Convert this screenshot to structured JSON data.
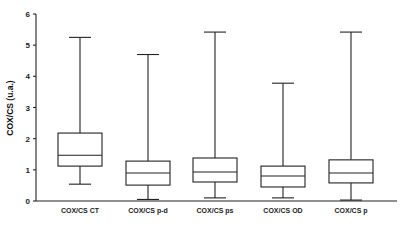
{
  "chart_data": {
    "type": "box",
    "title": "",
    "xlabel": "",
    "ylabel": "COX/CS (u.a.)",
    "ylim": [
      0,
      6
    ],
    "yticks": [
      0,
      1,
      2,
      3,
      4,
      5,
      6
    ],
    "grid": false,
    "categories": [
      "COX/CS CT",
      "COX/CS p-d",
      "COX/CS ps",
      "COX/CS OD",
      "COX/CS p"
    ],
    "series": [
      {
        "name": "COX/CS CT",
        "min": 0.54,
        "q1": 1.12,
        "median": 1.47,
        "q3": 2.18,
        "max": 5.25
      },
      {
        "name": "COX/CS p-d",
        "min": 0.05,
        "q1": 0.51,
        "median": 0.9,
        "q3": 1.28,
        "max": 4.7
      },
      {
        "name": "COX/CS ps",
        "min": 0.1,
        "q1": 0.61,
        "median": 0.93,
        "q3": 1.38,
        "max": 5.42
      },
      {
        "name": "COX/CS OD",
        "min": 0.1,
        "q1": 0.45,
        "median": 0.8,
        "q3": 1.12,
        "max": 3.78
      },
      {
        "name": "COX/CS p",
        "min": 0.03,
        "q1": 0.58,
        "median": 0.9,
        "q3": 1.32,
        "max": 5.42
      }
    ]
  }
}
